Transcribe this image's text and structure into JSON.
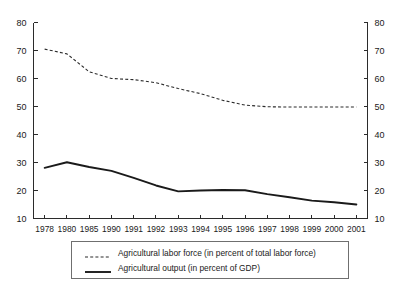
{
  "chart_data": {
    "type": "line",
    "title": "",
    "xlabel": "",
    "ylabel": "",
    "ylim": [
      10,
      80
    ],
    "ytick_values": [
      10,
      20,
      30,
      40,
      50,
      60,
      70,
      80
    ],
    "ytick_labels": [
      "10",
      "20",
      "30",
      "40",
      "50",
      "60",
      "70",
      "80"
    ],
    "right_axis": {
      "ylim": [
        10,
        80
      ],
      "ytick_labels": [
        "10",
        "20",
        "30",
        "40",
        "50",
        "60",
        "70",
        "80"
      ]
    },
    "grid": false,
    "legend_position": "below-center",
    "categories": [
      "1978",
      "1980",
      "1985",
      "1990",
      "1991",
      "1992",
      "1993",
      "1994",
      "1995",
      "1996",
      "1997",
      "1998",
      "1999",
      "2000",
      "2001"
    ],
    "series": [
      {
        "name": "Agricultural labor force (in percent of total labor force)",
        "style": "dashed",
        "color": "#2b2b2b",
        "values": [
          70.5,
          68.8,
          62.4,
          60.0,
          59.6,
          58.5,
          56.4,
          54.6,
          52.2,
          50.5,
          49.9,
          49.8,
          49.8,
          49.8,
          49.8
        ]
      },
      {
        "name": "Agricultural output (in percent of GDP)",
        "style": "solid",
        "color": "#1a1a1a",
        "values": [
          28.1,
          30.1,
          28.4,
          27.0,
          24.5,
          21.8,
          19.7,
          20.0,
          20.2,
          20.1,
          18.7,
          17.6,
          16.4,
          15.8,
          15.0
        ]
      }
    ],
    "legend": [
      {
        "label": "Agricultural labor force (in percent of total labor force)",
        "style": "dashed"
      },
      {
        "label": "Agricultural output (in percent of GDP)",
        "style": "solid"
      }
    ]
  }
}
